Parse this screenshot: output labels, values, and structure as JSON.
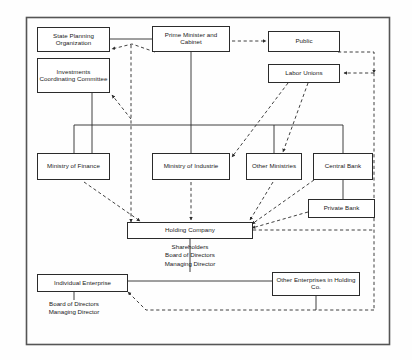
{
  "diagram": {
    "frame": {
      "x": 26,
      "y": 17,
      "width": 364,
      "height": 328
    },
    "style": {
      "background": "#fefefe",
      "line_color": "#2b2b2b",
      "box_fill": "#ffffff",
      "solid_line": "solid",
      "dashed_line": "dashed"
    },
    "nodes": [
      {
        "id": "state-planning-organization",
        "label": "State Planning\nOrganization",
        "x": 37,
        "y": 27,
        "width": 73,
        "height": 25
      },
      {
        "id": "investments-coordinating-committee",
        "label": "Investments\nCoordinating\nCommittee",
        "x": 37,
        "y": 58,
        "width": 73,
        "height": 35
      },
      {
        "id": "prime-minister-and-cabinet",
        "label": "Prime Minister\nand Cabinet",
        "x": 152,
        "y": 26,
        "width": 78,
        "height": 26
      },
      {
        "id": "public",
        "label": "Public",
        "x": 268,
        "y": 31,
        "width": 72,
        "height": 21
      },
      {
        "id": "labor-unions",
        "label": "Labor Unions",
        "x": 268,
        "y": 64,
        "width": 72,
        "height": 19
      },
      {
        "id": "ministry-of-finance",
        "label": "Ministry of\nFinance",
        "x": 37,
        "y": 153,
        "width": 73,
        "height": 27
      },
      {
        "id": "ministry-of-industrie",
        "label": "Ministry of\nIndustrie",
        "x": 152,
        "y": 153,
        "width": 78,
        "height": 27
      },
      {
        "id": "other-ministries",
        "label": "Other\nMinistries",
        "x": 246,
        "y": 153,
        "width": 56,
        "height": 27
      },
      {
        "id": "central-bank",
        "label": "Central Bank",
        "x": 313,
        "y": 153,
        "width": 60,
        "height": 27
      },
      {
        "id": "private-bank",
        "label": "Private Bank",
        "x": 308,
        "y": 199,
        "width": 67,
        "height": 19
      },
      {
        "id": "holding-company",
        "label": "Holding Company",
        "x": 127,
        "y": 222,
        "width": 126,
        "height": 17
      },
      {
        "id": "individual-enterprise",
        "label": "Individual Enterprise",
        "x": 37,
        "y": 274,
        "width": 91,
        "height": 18
      },
      {
        "id": "other-enterprises-in-holding-co",
        "label": "Other Enterprises in\nHolding Co.",
        "x": 272,
        "y": 272,
        "width": 88,
        "height": 24
      }
    ],
    "annotations": [
      {
        "id": "holding-company-governance",
        "label": "Shareholders\nBoard of Directors\nManaging Director",
        "x": 142,
        "y": 243,
        "width": 96
      },
      {
        "id": "individual-enterprise-governance",
        "label": "Board of Directors\nManaging Director",
        "x": 26,
        "y": 299,
        "width": 96
      }
    ],
    "edges": [
      {
        "id": "bus-trunk-horizontal",
        "type": "solid",
        "from": "state-planning-trunk",
        "to": "central-bank-trunk"
      },
      {
        "id": "state-planning-organization-to-prime-minister",
        "type": "solid",
        "from": "state-planning-organization",
        "to": "prime-minister-and-cabinet"
      },
      {
        "id": "prime-minister-to-bus",
        "type": "solid",
        "from": "prime-minister-and-cabinet",
        "to": "bus-trunk-horizontal"
      },
      {
        "id": "investments-committee-to-ministry-of-finance",
        "type": "solid",
        "from": "investments-coordinating-committee",
        "to": "ministry-of-finance"
      },
      {
        "id": "bus-to-ministry-of-finance",
        "type": "solid",
        "from": "bus-trunk-horizontal",
        "to": "ministry-of-finance"
      },
      {
        "id": "bus-to-ministry-of-industrie",
        "type": "solid",
        "from": "bus-trunk-horizontal",
        "to": "ministry-of-industrie"
      },
      {
        "id": "bus-to-other-ministries",
        "type": "solid",
        "from": "bus-trunk-horizontal",
        "to": "other-ministries"
      },
      {
        "id": "bus-to-central-bank",
        "type": "solid",
        "from": "bus-trunk-horizontal",
        "to": "central-bank"
      },
      {
        "id": "central-bank-to-private-bank",
        "type": "solid",
        "from": "central-bank",
        "to": "private-bank"
      },
      {
        "id": "holding-company-to-governance",
        "type": "solid",
        "from": "holding-company",
        "to": "holding-company-governance"
      },
      {
        "id": "individual-enterprise-to-other-enterprises",
        "type": "solid",
        "from": "individual-enterprise",
        "to": "other-enterprises-in-holding-co"
      },
      {
        "id": "individual-enterprise-to-governance",
        "type": "solid",
        "from": "individual-enterprise",
        "to": "individual-enterprise-governance"
      },
      {
        "id": "prime-minister-to-state-planning-feedback",
        "type": "dashed",
        "from": "prime-minister-and-cabinet",
        "to": "state-planning-organization",
        "arrow": true
      },
      {
        "id": "prime-minister-to-public",
        "type": "dashed",
        "from": "prime-minister-and-cabinet",
        "to": "public",
        "arrow": true
      },
      {
        "id": "public-to-outer-loop",
        "type": "dashed",
        "from": "public",
        "to": "right-loop",
        "arrow": true
      },
      {
        "id": "outer-loop-to-labor-unions",
        "type": "dashed",
        "from": "right-loop",
        "to": "labor-unions",
        "arrow": true
      },
      {
        "id": "holding-company-to-outer-loop",
        "type": "dashed",
        "from": "holding-company",
        "to": "right-loop",
        "arrow": true
      },
      {
        "id": "other-enterprises-to-outer-loop",
        "type": "dashed",
        "from": "other-enterprises-in-holding-co",
        "to": "right-loop",
        "arrow": true
      },
      {
        "id": "individual-enterprise-to-outer-loop",
        "type": "dashed",
        "from": "individual-enterprise",
        "to": "right-loop",
        "arrow": true
      },
      {
        "id": "vertical-dashed-spine-to-holding-company",
        "type": "dashed",
        "from": "prime-minister-and-cabinet",
        "to": "holding-company",
        "arrow": true
      },
      {
        "id": "dashed-spine-to-investments-committee",
        "type": "dashed",
        "from": "vertical-dashed-spine-to-holding-company",
        "to": "investments-coordinating-committee",
        "arrow": true
      },
      {
        "id": "labor-unions-to-ministry-of-industrie",
        "type": "dashed",
        "from": "labor-unions",
        "to": "ministry-of-industrie",
        "arrow": true
      },
      {
        "id": "labor-unions-to-other-ministries",
        "type": "dashed",
        "from": "labor-unions",
        "to": "other-ministries",
        "arrow": true
      },
      {
        "id": "ministry-of-finance-to-holding-company",
        "type": "dashed",
        "from": "ministry-of-finance",
        "to": "holding-company",
        "arrow": true
      },
      {
        "id": "ministry-of-industrie-to-holding-company",
        "type": "dashed",
        "from": "ministry-of-industrie",
        "to": "holding-company",
        "arrow": true
      },
      {
        "id": "other-ministries-to-holding-company",
        "type": "dashed",
        "from": "other-ministries",
        "to": "holding-company",
        "arrow": true
      },
      {
        "id": "central-bank-to-holding-company",
        "type": "dashed",
        "from": "central-bank",
        "to": "holding-company",
        "arrow": true
      },
      {
        "id": "private-bank-to-holding-company",
        "type": "dashed",
        "from": "private-bank",
        "to": "holding-company",
        "arrow": true
      }
    ]
  }
}
